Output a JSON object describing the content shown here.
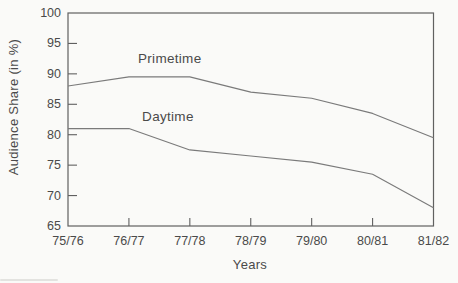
{
  "chart_data": {
    "type": "line",
    "title": "",
    "xlabel": "Years",
    "ylabel": "Audience Share (in %)",
    "categories": [
      "75/76",
      "76/77",
      "77/78",
      "78/79",
      "79/80",
      "80/81",
      "81/82"
    ],
    "series": [
      {
        "name": "Primetime",
        "values": [
          88,
          89.5,
          89.5,
          87,
          86,
          83.5,
          79.5
        ]
      },
      {
        "name": "Daytime",
        "values": [
          81,
          81,
          77.5,
          76.5,
          75.5,
          73.5,
          68
        ]
      }
    ],
    "ylim": [
      65,
      100
    ],
    "yticks": [
      100,
      95,
      90,
      85,
      80,
      75,
      70,
      65
    ],
    "grid": false,
    "frame": "closed-box",
    "tick_direction": "inward",
    "legend": "inline-labels",
    "annotations": [
      {
        "text": "Primetime",
        "x": 1.67,
        "y": 92.6
      },
      {
        "text": "Daytime",
        "x": 1.64,
        "y": 83.0
      }
    ],
    "colors": {
      "line": "#7a7a7a",
      "axis": "#606060",
      "text": "#4a4a4a",
      "background": "#fafaf8"
    }
  }
}
